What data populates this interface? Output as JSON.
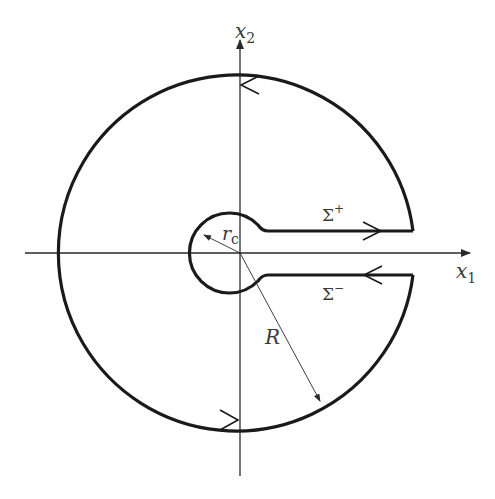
{
  "figure": {
    "axes": {
      "x_axis_label": "x",
      "x_axis_subscript": "1",
      "y_axis_label": "x",
      "y_axis_subscript": "2"
    },
    "labels": {
      "small_radius": "r",
      "small_radius_subscript": "c",
      "large_radius": "R",
      "upper_slit": "Σ",
      "upper_slit_superscript": "+",
      "lower_slit": "Σ",
      "lower_slit_superscript": "−"
    },
    "colors": {
      "contour": "#1a1a1a",
      "axes": "#2a2a2a",
      "text": "#3a3a3a",
      "background": "#ffffff"
    },
    "geometry": {
      "origin": [
        240,
        253
      ],
      "large_radius_px": 178,
      "small_radius_px": 40,
      "slit_half_gap_px": 22
    }
  }
}
